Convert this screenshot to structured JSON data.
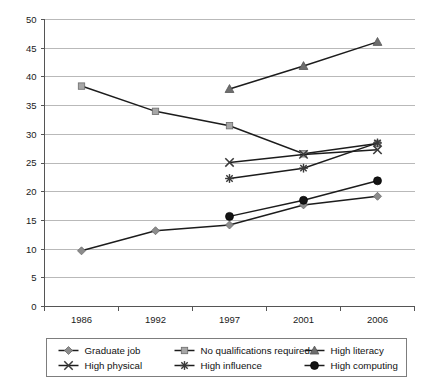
{
  "chart_data": {
    "type": "line",
    "title": "",
    "xlabel": "",
    "ylabel": "",
    "categories": [
      "1986",
      "1992",
      "1997",
      "2001",
      "2006"
    ],
    "ylim": [
      0,
      50
    ],
    "yticks": [
      0,
      5,
      10,
      15,
      20,
      25,
      30,
      35,
      40,
      45,
      50
    ],
    "grid": true,
    "legend_position": "bottom",
    "series": [
      {
        "name": "Graduate job",
        "marker": "diamond",
        "color": "#8c8c8c",
        "values": [
          9.7,
          13.2,
          14.2,
          17.7,
          19.2
        ]
      },
      {
        "name": "No qualifications required",
        "marker": "square",
        "color": "#a6a6a6",
        "values": [
          38.4,
          34.0,
          31.5,
          26.6,
          28.4
        ]
      },
      {
        "name": "High literacy",
        "marker": "triangle",
        "color": "#6e6e6e",
        "values": [
          null,
          null,
          37.9,
          41.9,
          46.1
        ]
      },
      {
        "name": "High physical",
        "marker": "cross",
        "color": "#3a3a3a",
        "values": [
          null,
          null,
          25.1,
          26.5,
          27.3
        ]
      },
      {
        "name": "High influence",
        "marker": "asterisk",
        "color": "#3a3a3a",
        "values": [
          null,
          null,
          22.3,
          24.1,
          28.5
        ]
      },
      {
        "name": "High computing",
        "marker": "circle",
        "color": "#141414",
        "values": [
          null,
          null,
          15.7,
          18.5,
          21.9
        ]
      }
    ]
  },
  "legend": {
    "items": [
      {
        "label": "Graduate job",
        "marker": "diamond",
        "color": "#8c8c8c"
      },
      {
        "label": "No qualifications required",
        "marker": "square",
        "color": "#a6a6a6"
      },
      {
        "label": "High literacy",
        "marker": "triangle",
        "color": "#6e6e6e"
      },
      {
        "label": "High physical",
        "marker": "cross",
        "color": "#3a3a3a"
      },
      {
        "label": "High influence",
        "marker": "asterisk",
        "color": "#3a3a3a"
      },
      {
        "label": "High computing",
        "marker": "circle",
        "color": "#141414"
      }
    ]
  }
}
